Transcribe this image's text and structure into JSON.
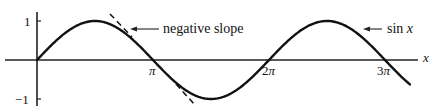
{
  "chart_data": {
    "type": "line",
    "title": "",
    "xlabel": "x",
    "ylabel": "",
    "xlim": [
      0,
      10.1
    ],
    "ylim": [
      -1,
      1
    ],
    "grid": false,
    "x_ticks": [
      {
        "value": 3.14159,
        "label": "π"
      },
      {
        "value": 6.28319,
        "label": "2π"
      },
      {
        "value": 9.42478,
        "label": "3π"
      }
    ],
    "y_ticks": [
      {
        "value": 1,
        "label": "1"
      },
      {
        "value": -1,
        "label": "−1"
      }
    ],
    "series": [
      {
        "name": "sin x",
        "function": "sin(x)",
        "x_range": [
          0,
          10.1
        ],
        "style": "solid"
      },
      {
        "name": "tangent at π",
        "function": "-(x - π)",
        "x_range": [
          1.96,
          4.2
        ],
        "style": "dashed"
      }
    ],
    "annotations": [
      {
        "text": "negative slope",
        "points_to": "tangent line near x ≈ 2.6"
      },
      {
        "text_main": "sin ",
        "text_var": "x",
        "points_to": "sin x curve near x ≈ 8.9"
      }
    ]
  },
  "labels": {
    "x_axis": "x",
    "y_tick_pos": "1",
    "y_tick_neg": "−1",
    "x_tick_pi": "π",
    "x_tick_2pi_coef": "2",
    "x_tick_2pi_sym": "π",
    "x_tick_3pi_coef": "3",
    "x_tick_3pi_sym": "π",
    "annotation_slope": "negative slope",
    "annotation_sin_fn": "sin ",
    "annotation_sin_var": "x"
  }
}
